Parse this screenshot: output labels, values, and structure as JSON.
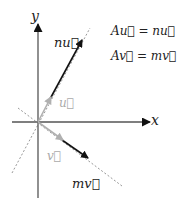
{
  "diagram": {
    "axes": {
      "x_label": "x",
      "y_label": "y"
    },
    "vectors": {
      "u_label": "u⃗",
      "v_label": "v⃗",
      "nu_label": "nu⃗",
      "mv_label": "mv⃗"
    },
    "equations": [
      "Au⃗ = nu⃗",
      "Av⃗ = mv⃗"
    ],
    "colors": {
      "axis": "#555555",
      "base_vector": "#aaaaaa",
      "scaled_vector": "#222222",
      "dashed_line": "#888888",
      "text": "#222222",
      "light_text": "#aaaaaa"
    }
  }
}
